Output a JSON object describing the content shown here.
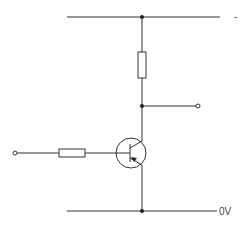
{
  "diagram": {
    "type": "circuit-schematic",
    "title": "",
    "labels": {
      "supply": "-",
      "ground": "0V"
    },
    "components": [
      {
        "id": "R1",
        "type": "resistor",
        "orientation": "vertical",
        "position": "collector-load"
      },
      {
        "id": "R2",
        "type": "resistor",
        "orientation": "horizontal",
        "position": "base-input"
      },
      {
        "id": "Q1",
        "type": "transistor",
        "subtype": "pnp-bjt"
      }
    ],
    "terminals": [
      {
        "id": "input",
        "side": "left"
      },
      {
        "id": "output",
        "side": "right"
      }
    ],
    "rails": [
      {
        "id": "supply-rail",
        "label": "-"
      },
      {
        "id": "ground-rail",
        "label": "0V"
      }
    ]
  }
}
